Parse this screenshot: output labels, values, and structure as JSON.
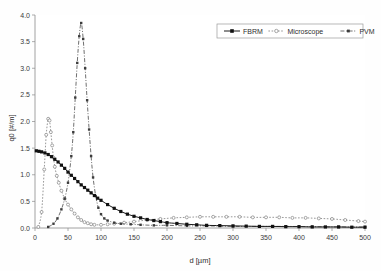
{
  "chart_data": {
    "type": "line",
    "title": "",
    "xlabel": "d [µm]",
    "ylabel": "q0 [#/m]",
    "xlim": [
      0,
      500
    ],
    "ylim": [
      0,
      4.0
    ],
    "xticks": [
      "0",
      "50",
      "100",
      "150",
      "200",
      "250",
      "300",
      "350",
      "400",
      "450",
      "500"
    ],
    "xtick_values": [
      0,
      50,
      100,
      150,
      200,
      250,
      300,
      350,
      400,
      450,
      500
    ],
    "yticks": [
      "0.0",
      "0.5",
      "1.0",
      "1.5",
      "2.0",
      "2.5",
      "3.0",
      "3.5",
      "4.0"
    ],
    "ytick_values": [
      0.0,
      0.5,
      1.0,
      1.5,
      2.0,
      2.5,
      3.0,
      3.5,
      4.0
    ],
    "grid": false,
    "legend_position": "top-right",
    "series": [
      {
        "name": "FBRM",
        "marker": "filled-square",
        "line": "solid",
        "color": "#1a1a1a",
        "x": [
          2,
          6,
          10,
          15,
          20,
          25,
          30,
          35,
          40,
          45,
          50,
          55,
          60,
          65,
          70,
          75,
          80,
          85,
          90,
          95,
          100,
          110,
          120,
          130,
          140,
          150,
          160,
          170,
          180,
          190,
          200,
          215,
          230,
          245,
          260,
          280,
          300,
          320,
          340,
          360,
          380,
          400,
          420,
          440,
          460,
          480,
          500
        ],
        "y": [
          1.45,
          1.44,
          1.43,
          1.41,
          1.38,
          1.34,
          1.29,
          1.24,
          1.18,
          1.12,
          1.05,
          0.99,
          0.93,
          0.87,
          0.81,
          0.76,
          0.71,
          0.66,
          0.61,
          0.56,
          0.52,
          0.44,
          0.37,
          0.31,
          0.26,
          0.22,
          0.19,
          0.16,
          0.14,
          0.12,
          0.1,
          0.085,
          0.07,
          0.06,
          0.05,
          0.045,
          0.04,
          0.035,
          0.03,
          0.03,
          0.025,
          0.025,
          0.02,
          0.02,
          0.02,
          0.015,
          0.015
        ]
      },
      {
        "name": "Microscope",
        "marker": "open-circle",
        "line": "dotted",
        "color": "#7d7d7d",
        "x": [
          5,
          10,
          14,
          17,
          20,
          22,
          24,
          26,
          28,
          30,
          33,
          36,
          40,
          45,
          50,
          55,
          60,
          65,
          70,
          75,
          80,
          85,
          90,
          100,
          110,
          120,
          135,
          150,
          170,
          190,
          210,
          230,
          250,
          270,
          290,
          310,
          330,
          350,
          370,
          390,
          410,
          430,
          450,
          470,
          490,
          500
        ],
        "y": [
          0.02,
          0.3,
          1.1,
          1.75,
          2.05,
          2.02,
          1.8,
          1.55,
          1.32,
          1.15,
          0.98,
          0.85,
          0.7,
          0.55,
          0.44,
          0.35,
          0.27,
          0.2,
          0.15,
          0.11,
          0.09,
          0.07,
          0.06,
          0.06,
          0.07,
          0.08,
          0.1,
          0.12,
          0.15,
          0.17,
          0.19,
          0.2,
          0.21,
          0.21,
          0.21,
          0.21,
          0.2,
          0.2,
          0.2,
          0.19,
          0.19,
          0.18,
          0.17,
          0.15,
          0.13,
          0.12
        ]
      },
      {
        "name": "PVM",
        "marker": "filled-small",
        "line": "dash-dot",
        "color": "#4a4a4a",
        "x": [
          20,
          28,
          34,
          40,
          45,
          50,
          55,
          58,
          61,
          64,
          67,
          70,
          73,
          76,
          79,
          82,
          85,
          88,
          92,
          96,
          100,
          105,
          110,
          120,
          130,
          145,
          160,
          180,
          200,
          230,
          260,
          300,
          340,
          380,
          420,
          460,
          500
        ],
        "y": [
          0.02,
          0.08,
          0.18,
          0.35,
          0.55,
          0.85,
          1.35,
          1.8,
          2.45,
          3.1,
          3.6,
          3.85,
          3.55,
          3.0,
          2.4,
          1.85,
          1.35,
          0.95,
          0.6,
          0.38,
          0.26,
          0.18,
          0.14,
          0.1,
          0.08,
          0.07,
          0.06,
          0.05,
          0.05,
          0.04,
          0.04,
          0.03,
          0.03,
          0.03,
          0.025,
          0.02,
          0.02
        ]
      }
    ]
  },
  "legend": {
    "items": [
      {
        "label": "FBRM"
      },
      {
        "label": "Microscope"
      },
      {
        "label": "PVM"
      }
    ]
  }
}
